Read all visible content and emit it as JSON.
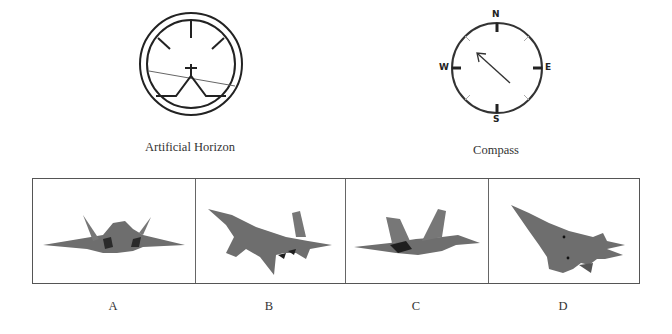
{
  "instruments": {
    "horizon": {
      "label": "Artificial Horizon",
      "horizon_tilt": "left-high, right-low",
      "colors": {
        "stroke": "#222222",
        "horizon_line": "#555555"
      }
    },
    "compass": {
      "label": "Compass",
      "cardinals": {
        "north": "N",
        "east": "E",
        "south": "S",
        "west": "W"
      },
      "needle_direction": "NW",
      "colors": {
        "stroke": "#333333",
        "minor_ticks": "#aaaaaa"
      }
    }
  },
  "options": [
    {
      "label": "A",
      "description": "aircraft front view, level, banked slightly"
    },
    {
      "label": "B",
      "description": "aircraft top view, nose pointing up-left, banked"
    },
    {
      "label": "C",
      "description": "aircraft side profile, nose right"
    },
    {
      "label": "D",
      "description": "aircraft view, nose pointing up-left, underside visible"
    }
  ],
  "colors": {
    "aircraft": "#6e6e6e",
    "aircraft_dark": "#3a3a3a",
    "border": "#555555"
  }
}
